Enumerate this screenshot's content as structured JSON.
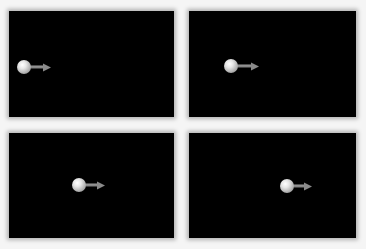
{
  "figure": {
    "background_color": "#f5f5f5",
    "panel_color": "#000000",
    "frames": [
      {
        "label": "",
        "panel": {
          "x": 9,
          "y": 11,
          "w": 165,
          "h": 106
        },
        "ball": {
          "cx": 24,
          "cy": 67
        },
        "arrow_tip_x": 51
      },
      {
        "label": "",
        "panel": {
          "x": 189,
          "y": 11,
          "w": 167,
          "h": 106
        },
        "ball": {
          "cx": 231,
          "cy": 66
        },
        "arrow_tip_x": 259
      },
      {
        "label": "",
        "panel": {
          "x": 9,
          "y": 133,
          "w": 165,
          "h": 105
        },
        "ball": {
          "cx": 79,
          "cy": 185
        },
        "arrow_tip_x": 105
      },
      {
        "label": "",
        "panel": {
          "x": 189,
          "y": 133,
          "w": 167,
          "h": 105
        },
        "ball": {
          "cx": 287,
          "cy": 186
        },
        "arrow_tip_x": 312
      }
    ]
  }
}
